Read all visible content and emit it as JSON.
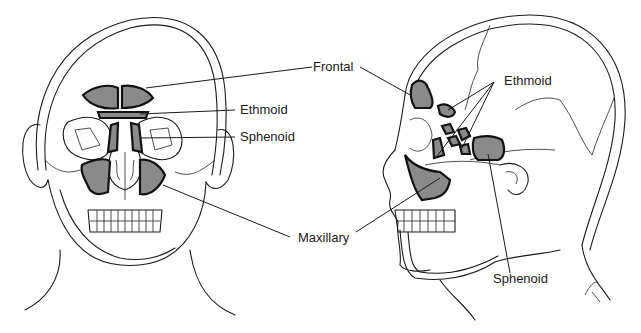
{
  "diagram": {
    "views": [
      {
        "name": "frontal-view",
        "labels": [
          "Frontal",
          "Ethmoid",
          "Sphenoid",
          "Maxillary"
        ]
      },
      {
        "name": "lateral-view",
        "labels": [
          "Frontal",
          "Ethmoid",
          "Sphenoid",
          "Maxillary"
        ]
      }
    ],
    "labels": {
      "frontal": "Frontal",
      "ethmoid_front": "Ethmoid",
      "sphenoid_front": "Sphenoid",
      "maxillary": "Maxillary",
      "ethmoid_side": "Ethmoid",
      "sphenoid_side": "Sphenoid"
    },
    "signature": "Gaska",
    "colors": {
      "sinus_fill": "#8a8a8a",
      "line": "#1a1a1a",
      "background": "#ffffff"
    }
  }
}
